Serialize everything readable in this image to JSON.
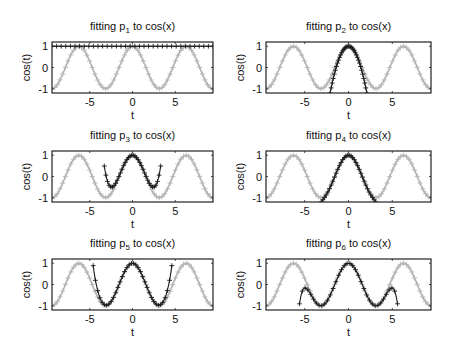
{
  "figure": {
    "width": 449,
    "height": 356,
    "colors": {
      "reference": "#b4b4b4",
      "fit": "#1a1a1a",
      "axes": "#222222"
    }
  },
  "chart_data": [
    {
      "type": "line",
      "title": "fitting p1 to cos(x)",
      "title_parts": {
        "prefix": "fitting p",
        "sub": "1",
        "suffix": " to cos(x)"
      },
      "xlabel": "t",
      "ylabel": "cos(t)",
      "xlim": [
        -9.42,
        9.42
      ],
      "ylim": [
        -1.2,
        1.2
      ],
      "xticks": [
        -5,
        0,
        5
      ],
      "yticks": [
        -1,
        0,
        1
      ],
      "series": [
        {
          "name": "cos(t)",
          "color": "#b4b4b4",
          "marker": "+",
          "function": "cos"
        },
        {
          "name": "p1(t)",
          "color": "#1a1a1a",
          "marker": "+",
          "taylor_degree": 0,
          "coeffs": [
            1
          ],
          "x_range": [
            -9.42,
            9.42
          ]
        }
      ]
    },
    {
      "type": "line",
      "title": "fitting p2 to cos(x)",
      "title_parts": {
        "prefix": "fitting p",
        "sub": "2",
        "suffix": " to cos(x)"
      },
      "xlabel": "t",
      "ylabel": "cos(t)",
      "xlim": [
        -9.42,
        9.42
      ],
      "ylim": [
        -1.2,
        1.2
      ],
      "xticks": [
        -5,
        0,
        5
      ],
      "yticks": [
        -1,
        0,
        1
      ],
      "series": [
        {
          "name": "cos(t)",
          "color": "#b4b4b4",
          "marker": "+",
          "function": "cos"
        },
        {
          "name": "p2(t)",
          "color": "#1a1a1a",
          "marker": "+",
          "taylor_degree": 2,
          "coeffs": [
            1,
            0,
            -0.5
          ],
          "x_range": [
            -2.1,
            2.1
          ]
        }
      ]
    },
    {
      "type": "line",
      "title": "fitting p3 to cos(x)",
      "title_parts": {
        "prefix": "fitting p",
        "sub": "3",
        "suffix": " to cos(x)"
      },
      "xlabel": "t",
      "ylabel": "cos(t)",
      "xlim": [
        -9.42,
        9.42
      ],
      "ylim": [
        -1.2,
        1.2
      ],
      "xticks": [
        -5,
        0,
        5
      ],
      "yticks": [
        -1,
        0,
        1
      ],
      "series": [
        {
          "name": "cos(t)",
          "color": "#b4b4b4",
          "marker": "+",
          "function": "cos"
        },
        {
          "name": "p3(t)",
          "color": "#1a1a1a",
          "marker": "+",
          "taylor_degree": 4,
          "coeffs": [
            1,
            0,
            -0.5,
            0,
            0.0416667
          ],
          "x_range": [
            -3.3,
            3.3
          ],
          "min_value": -0.5
        }
      ]
    },
    {
      "type": "line",
      "title": "fitting p4 to cos(x)",
      "title_parts": {
        "prefix": "fitting p",
        "sub": "4",
        "suffix": " to cos(x)"
      },
      "xlabel": "t",
      "ylabel": "cos(t)",
      "xlim": [
        -9.42,
        9.42
      ],
      "ylim": [
        -1.2,
        1.2
      ],
      "xticks": [
        -5,
        0,
        5
      ],
      "yticks": [
        -1,
        0,
        1
      ],
      "series": [
        {
          "name": "cos(t)",
          "color": "#b4b4b4",
          "marker": "+",
          "function": "cos"
        },
        {
          "name": "p4(t)",
          "color": "#1a1a1a",
          "marker": "+",
          "taylor_degree": 6,
          "coeffs": [
            1,
            0,
            -0.5,
            0,
            0.0416667,
            0,
            -0.00138889
          ],
          "x_range": [
            -3.3,
            3.3
          ]
        }
      ]
    },
    {
      "type": "line",
      "title": "fitting p5 to cos(x)",
      "title_parts": {
        "prefix": "fitting p",
        "sub": "5",
        "suffix": " to cos(x)"
      },
      "xlabel": "t",
      "ylabel": "cos(t)",
      "xlim": [
        -9.42,
        9.42
      ],
      "ylim": [
        -1.2,
        1.2
      ],
      "xticks": [
        -5,
        0,
        5
      ],
      "yticks": [
        -1,
        0,
        1
      ],
      "series": [
        {
          "name": "cos(t)",
          "color": "#b4b4b4",
          "marker": "+",
          "function": "cos"
        },
        {
          "name": "p5(t)",
          "color": "#1a1a1a",
          "marker": "+",
          "taylor_degree": 8,
          "coeffs": [
            1,
            0,
            -0.5,
            0,
            0.0416667,
            0,
            -0.00138889,
            0,
            2.48016e-05
          ],
          "x_range": [
            -4.6,
            4.6
          ]
        }
      ]
    },
    {
      "type": "line",
      "title": "fitting p6 to cos(x)",
      "title_parts": {
        "prefix": "fitting p",
        "sub": "6",
        "suffix": " to cos(x)"
      },
      "xlabel": "t",
      "ylabel": "cos(t)",
      "xlim": [
        -9.42,
        9.42
      ],
      "ylim": [
        -1.2,
        1.2
      ],
      "xticks": [
        -5,
        0,
        5
      ],
      "yticks": [
        -1,
        0,
        1
      ],
      "series": [
        {
          "name": "cos(t)",
          "color": "#b4b4b4",
          "marker": "+",
          "function": "cos"
        },
        {
          "name": "p6(t)",
          "color": "#1a1a1a",
          "marker": "+",
          "taylor_degree": 10,
          "coeffs": [
            1,
            0,
            -0.5,
            0,
            0.0416667,
            0,
            -0.00138889,
            0,
            2.48016e-05,
            0,
            -2.75573e-07
          ],
          "x_range": [
            -5.6,
            5.6
          ]
        }
      ]
    }
  ],
  "layout": {
    "panels": [
      {
        "box": [
          52,
          42,
          161,
          51
        ]
      },
      {
        "box": [
          266,
          42,
          165,
          51
        ]
      },
      {
        "box": [
          52,
          151,
          161,
          51
        ]
      },
      {
        "box": [
          266,
          151,
          165,
          51
        ]
      },
      {
        "box": [
          52,
          259,
          161,
          51
        ]
      },
      {
        "box": [
          266,
          259,
          165,
          51
        ]
      }
    ]
  }
}
